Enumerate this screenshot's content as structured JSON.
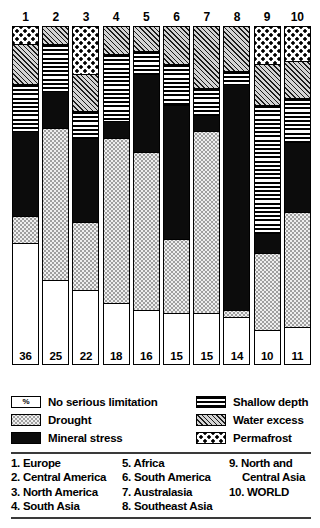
{
  "chart_data": {
    "type": "bar",
    "stacked": true,
    "orientation": "vertical",
    "title": "",
    "xlabel": "",
    "ylabel": "",
    "ylim": [
      0,
      100
    ],
    "units": "percent of land area",
    "grid": false,
    "legend_position": "below-chart",
    "categories": [
      "1",
      "2",
      "3",
      "4",
      "5",
      "6",
      "7",
      "8",
      "9",
      "10"
    ],
    "category_names": [
      "Europe",
      "Central America",
      "North America",
      "South Asia",
      "Africa",
      "South America",
      "Australasia",
      "Southeast Asia",
      "North and Central Asia",
      "WORLD"
    ],
    "series": [
      {
        "name": "No serious limitation",
        "pattern": "none",
        "values": [
          36,
          25,
          22,
          18,
          16,
          15,
          15,
          14,
          10,
          11
        ]
      },
      {
        "name": "Drought",
        "pattern": "drought",
        "values": [
          8,
          45,
          20,
          49,
          47,
          22,
          54,
          2,
          23,
          34
        ]
      },
      {
        "name": "Mineral stress",
        "pattern": "mineral",
        "values": [
          25,
          11,
          25,
          5,
          23,
          40,
          5,
          67,
          6,
          21
        ]
      },
      {
        "name": "Shallow depth",
        "pattern": "shallow",
        "values": [
          14,
          14,
          8,
          20,
          7,
          12,
          8,
          4,
          38,
          13
        ]
      },
      {
        "name": "Water excess",
        "pattern": "water",
        "values": [
          12,
          5,
          11,
          8,
          7,
          11,
          18,
          13,
          12,
          11
        ]
      },
      {
        "name": "Permafrost",
        "pattern": "permafrost",
        "values": [
          5,
          0,
          14,
          0,
          0,
          0,
          0,
          0,
          11,
          10
        ]
      }
    ],
    "bar_values_label": [
      36,
      25,
      22,
      18,
      16,
      15,
      15,
      14,
      10,
      11
    ]
  },
  "legend": {
    "left": [
      {
        "label": "No serious limitation",
        "pattern": "none",
        "swatch_text": "%"
      },
      {
        "label": "Drought",
        "pattern": "drought",
        "swatch_text": ""
      },
      {
        "label": "Mineral stress",
        "pattern": "mineral",
        "swatch_text": ""
      }
    ],
    "right": [
      {
        "label": "Shallow depth",
        "pattern": "shallow",
        "swatch_text": ""
      },
      {
        "label": "Water excess",
        "pattern": "water",
        "swatch_text": ""
      },
      {
        "label": "Permafrost",
        "pattern": "permafrost",
        "swatch_text": ""
      }
    ]
  },
  "regions": {
    "column1": [
      {
        "text": "1. Europe",
        "cont": ""
      },
      {
        "text": "2. Central America",
        "cont": ""
      },
      {
        "text": "3. North America",
        "cont": ""
      },
      {
        "text": "4. South Asia",
        "cont": ""
      }
    ],
    "column2": [
      {
        "text": "5. Africa",
        "cont": ""
      },
      {
        "text": "6. South America",
        "cont": ""
      },
      {
        "text": "7. Australasia",
        "cont": ""
      },
      {
        "text": "8. Southeast Asia",
        "cont": ""
      }
    ],
    "column3": [
      {
        "text": "9. North and",
        "cont": "Central Asia"
      },
      {
        "text": "10. WORLD",
        "cont": ""
      }
    ]
  },
  "colors": {
    "ink": "#000000",
    "paper": "#ffffff",
    "drought_fill": "#efefef",
    "water_fill": "#d4d4d4",
    "rule": "#3a3a3a"
  }
}
